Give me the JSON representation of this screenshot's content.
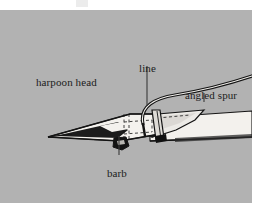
{
  "page": {
    "background_color": "#ffffff",
    "top_remnant": ""
  },
  "figure": {
    "name": "harpoon-head-diagram",
    "panel_background_color": "#b2b2b2",
    "ink_color": "#141414",
    "fill_color": "#f2f0ec",
    "panel": {
      "x": 0,
      "y": 10,
      "width": 252,
      "height": 193
    },
    "labels": [
      {
        "id": "harpoon-head",
        "text": "harpoon head",
        "x": 36,
        "y": 66
      },
      {
        "id": "line",
        "text": "line",
        "x": 139,
        "y": 52
      },
      {
        "id": "angled-spur",
        "text": "angled spur",
        "x": 185,
        "y": 79
      },
      {
        "id": "barb",
        "text": "barb",
        "x": 107,
        "y": 157
      }
    ],
    "leaders": [
      {
        "id": "leader-line",
        "from": [
          147,
          66
        ],
        "to": [
          147,
          103
        ]
      },
      {
        "id": "leader-angled-spur",
        "from": [
          204,
          93
        ],
        "to": [
          204,
          100
        ]
      },
      {
        "id": "leader-barb",
        "from": [
          119,
          155
        ],
        "to": [
          119,
          131
        ]
      }
    ],
    "parts": [
      "harpoon head",
      "line",
      "angled spur",
      "barb",
      "lashing",
      "shaft"
    ]
  }
}
